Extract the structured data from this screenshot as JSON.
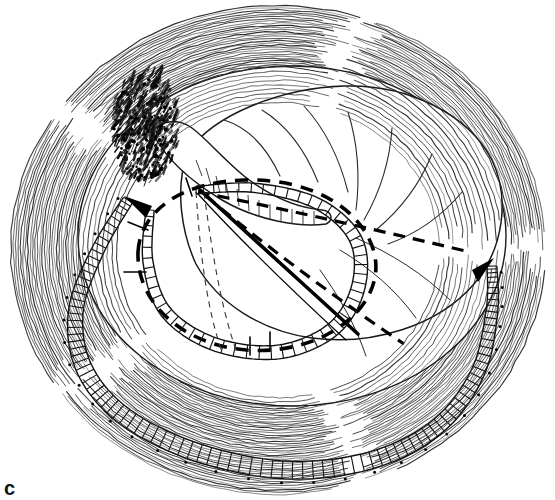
{
  "figure": {
    "panel_label": "c",
    "caption_label": "c",
    "type": "anatomical-line-drawing",
    "canvas": {
      "width": 555,
      "height": 500,
      "background": "#ffffff"
    },
    "colors": {
      "ink": "#000000",
      "hatch": "#2b2b2b",
      "light_ink": "#555555",
      "background": "#ffffff",
      "shadow": "#111111"
    },
    "regions": [
      {
        "name": "outer-hatched-ring",
        "description": "Dense concentric arc hatching forming the chest wall ring",
        "center": [
          278,
          250
        ],
        "outer_radius": 252,
        "inner_radius": 150,
        "line_count": 46
      },
      {
        "name": "inner-cavity",
        "description": "White oval cavity containing the lobe",
        "center": [
          290,
          238
        ],
        "rx": 215,
        "ry": 170
      },
      {
        "name": "lung-lobe",
        "description": "Large white lobe with curved fissure lines in upper right",
        "fissure_count": 7
      },
      {
        "name": "dark-stipple-patch",
        "description": "Dark stippled shading at upper-left of cavity",
        "center": [
          148,
          128
        ]
      },
      {
        "name": "ladder-band-outer",
        "description": "Rung/ladder patterned band sweeping from left around the bottom to the right",
        "rung_count": 96
      },
      {
        "name": "ladder-band-inner",
        "description": "Rung patterned band around central oval aperture",
        "rung_count": 54
      },
      {
        "name": "dashed-incision-oval",
        "description": "Heavy dashed oval outlining the central aperture",
        "center": [
          250,
          262
        ],
        "rx": 120,
        "ry": 88
      },
      {
        "name": "dashed-wedge",
        "description": "Dashed triangular wedge extending to the right of the aperture"
      },
      {
        "name": "solid-diagonal",
        "description": "Thick solid diagonal line across the central aperture"
      },
      {
        "name": "fine-dashed-pair",
        "description": "Two fine vertical dashed lines inside the aperture"
      },
      {
        "name": "arrow-left",
        "description": "Band tip forming arrow at upper-left",
        "at": [
          128,
          200
        ]
      },
      {
        "name": "arrow-right",
        "description": "Band tip forming arrow at right",
        "at": [
          490,
          262
        ]
      }
    ]
  }
}
